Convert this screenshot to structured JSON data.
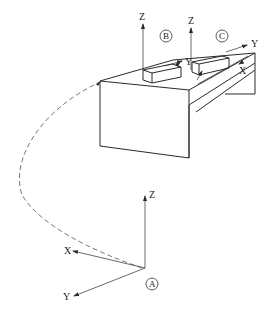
{
  "diagram": {
    "type": "coordinate-frames-workpiece",
    "frames": [
      {
        "id": "A",
        "label": "A",
        "axes": {
          "x": "X",
          "y": "Y",
          "z": "Z"
        }
      },
      {
        "id": "B",
        "label": "B",
        "axes": {
          "y": "Y",
          "z": "Z"
        }
      },
      {
        "id": "C",
        "label": "C",
        "axes": {
          "x": "X",
          "y": "Y",
          "z": "Z"
        }
      }
    ],
    "path": {
      "style": "dashed",
      "from": "A",
      "to": "workpiece"
    },
    "colors": {
      "line": "#2a2a2a",
      "dash": "#777777",
      "background": "#ffffff"
    }
  }
}
